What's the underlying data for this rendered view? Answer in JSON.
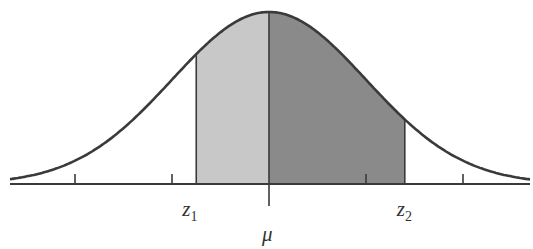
{
  "chart_data": {
    "type": "area",
    "title": "",
    "distribution": {
      "mean_label": "μ",
      "mean": 0,
      "sd": 1
    },
    "x_range": [
      -2.7,
      2.7
    ],
    "ticks_sd": [
      -2,
      -1,
      1,
      2
    ],
    "bounds": {
      "z1": -0.75,
      "z2": 1.4
    },
    "regions": [
      {
        "name": "z1 to mu",
        "from": -0.75,
        "to": 0,
        "color": "#c8c8c8"
      },
      {
        "name": "mu to z2",
        "from": 0,
        "to": 1.4,
        "color": "#8a8a8a"
      }
    ],
    "labels": {
      "z1": "z",
      "z1_sub": "1",
      "z2": "z",
      "z2_sub": "2",
      "mu": "μ"
    },
    "line_color": "#3a3a3a"
  }
}
